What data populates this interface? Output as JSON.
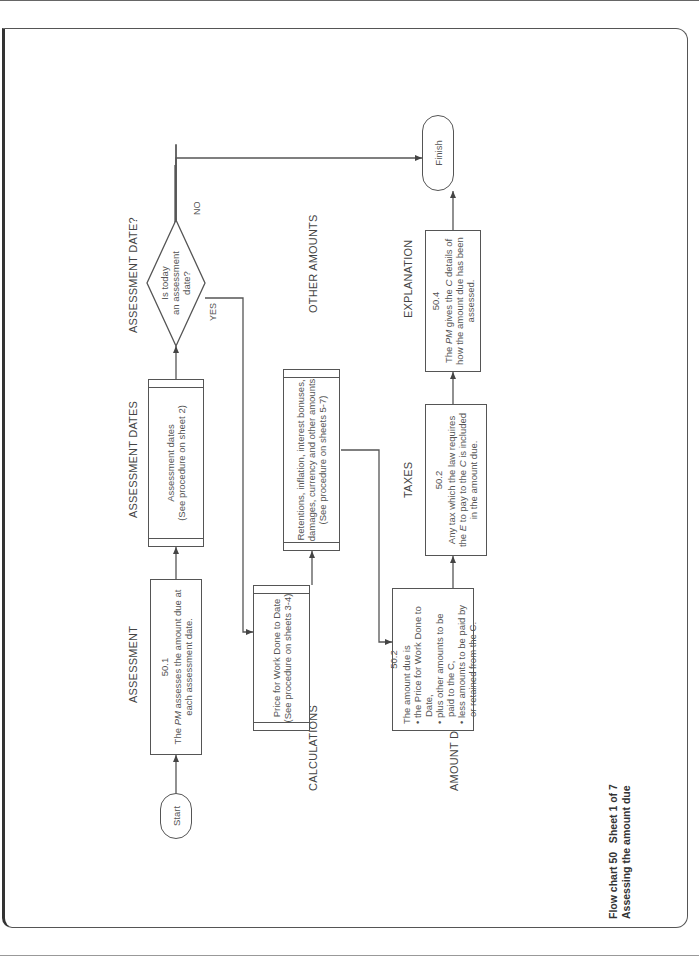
{
  "chart": {
    "title": "Flow chart 50",
    "sheet": "Sheet 1 of 7",
    "subtitle": "Assessing the amount due"
  },
  "lanes": {
    "assessment": "ASSESSMENT",
    "assessment_dates": "ASSESSMENT DATES",
    "assessment_date_q": "ASSESSMENT DATE?",
    "calculations": "CALCULATIONS",
    "other_amounts": "OTHER AMOUNTS",
    "amount_due": "AMOUNT DUE",
    "taxes": "TAXES",
    "explanation": "EXPLANATION"
  },
  "nodes": {
    "start": "Start",
    "finish": "Finish",
    "assessment": {
      "ref": "50.1",
      "text_prefix": "The ",
      "text_em": "PM",
      "text_suffix": " assesses the amount due at each assessment date."
    },
    "assessment_dates": {
      "line1": "Assessment dates",
      "line2": "(See procedure on sheet 2)"
    },
    "decision": {
      "line1": "Is today",
      "line2": "an assessment",
      "line3": "date?",
      "yes": "YES",
      "no": "NO"
    },
    "price_for_work": {
      "line1": "Price for Work Done to Date",
      "line2": "(See procedure on sheets 3-4)"
    },
    "other_amounts": {
      "line1": "Retentions, inflation, interest bonuses,",
      "line2": "damages, currency and other amounts",
      "line3": "(See procedure on sheets 5-7)"
    },
    "amount_due": {
      "ref": "50.2",
      "intro": "The amount due is",
      "bullets": [
        "• the Price for Work Done to Date,",
        "• plus other amounts to be paid to the C,",
        "• less amounts to be paid by or retained from the C."
      ]
    },
    "taxes": {
      "ref": "50.2",
      "text_prefix": "Any tax which the law requires the ",
      "text_em1": "E",
      "text_mid": " to pay to the ",
      "text_em2": "C",
      "text_suffix": " is included in the amount due."
    },
    "explanation": {
      "ref": "50.4",
      "text_prefix": "The ",
      "text_em1": "PM",
      "text_mid": " gives the ",
      "text_em2": "C",
      "text_suffix": " details of how the amount due has been assessed."
    }
  },
  "colors": {
    "line": "#555555",
    "text": "#444444",
    "background": "#ffffff"
  }
}
